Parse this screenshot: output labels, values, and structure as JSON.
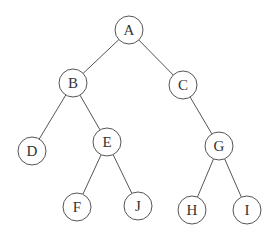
{
  "diagram": {
    "type": "binary-tree",
    "node_radius": 14,
    "nodes": [
      {
        "id": "A",
        "label": "A",
        "x": 129,
        "y": 30
      },
      {
        "id": "B",
        "label": "B",
        "x": 73,
        "y": 83
      },
      {
        "id": "C",
        "label": "C",
        "x": 183,
        "y": 85
      },
      {
        "id": "D",
        "label": "D",
        "x": 32,
        "y": 151
      },
      {
        "id": "E",
        "label": "E",
        "x": 107,
        "y": 142
      },
      {
        "id": "G",
        "label": "G",
        "x": 219,
        "y": 146
      },
      {
        "id": "F",
        "label": "F",
        "x": 77,
        "y": 207
      },
      {
        "id": "J",
        "label": "J",
        "x": 138,
        "y": 206
      },
      {
        "id": "H",
        "label": "H",
        "x": 192,
        "y": 210
      },
      {
        "id": "I",
        "label": "I",
        "x": 247,
        "y": 210
      }
    ],
    "edges": [
      [
        "A",
        "B"
      ],
      [
        "A",
        "C"
      ],
      [
        "B",
        "D"
      ],
      [
        "B",
        "E"
      ],
      [
        "C",
        "G"
      ],
      [
        "E",
        "F"
      ],
      [
        "E",
        "J"
      ],
      [
        "G",
        "H"
      ],
      [
        "G",
        "I"
      ]
    ]
  }
}
